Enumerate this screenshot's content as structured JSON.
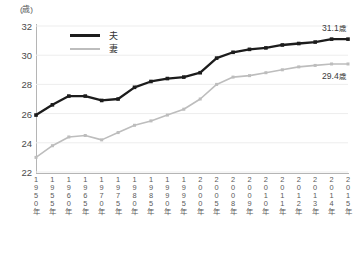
{
  "axis": {
    "unit_label": "(歳)",
    "y_ticks": [
      "32",
      "30",
      "28",
      "26",
      "24",
      "22"
    ],
    "x_ticks": [
      "1950年",
      "1955年",
      "1960年",
      "1965年",
      "1970年",
      "1975年",
      "1980年",
      "1985年",
      "1990年",
      "1995年",
      "2000年",
      "2005年",
      "2008年",
      "2009年",
      "2010年",
      "2011年",
      "2012年",
      "2013年",
      "2014年",
      "2015年"
    ]
  },
  "legend": {
    "items": [
      {
        "label": "夫",
        "color": "#1c1c1c"
      },
      {
        "label": "妻",
        "color": "#bdbdbd"
      }
    ]
  },
  "annotations": {
    "husband_end_value": "31.1",
    "husband_end_unit": "歳",
    "wife_end_value": "29.4",
    "wife_end_unit": "歳"
  },
  "chart_data": {
    "type": "line",
    "title": "",
    "subtitle": "",
    "xlabel": "",
    "ylabel": "(歳)",
    "ylim": [
      22,
      32
    ],
    "ytick_step": 2,
    "grid": true,
    "legend_position": "top-left",
    "categories": [
      "1950年",
      "1955年",
      "1960年",
      "1965年",
      "1970年",
      "1975年",
      "1980年",
      "1985年",
      "1990年",
      "1995年",
      "2000年",
      "2005年",
      "2008年",
      "2009年",
      "2010年",
      "2011年",
      "2012年",
      "2013年",
      "2014年",
      "2015年"
    ],
    "series": [
      {
        "name": "夫",
        "color": "#1c1c1c",
        "values": [
          25.9,
          26.6,
          27.2,
          27.2,
          26.9,
          27.0,
          27.8,
          28.2,
          28.4,
          28.5,
          28.8,
          29.8,
          30.2,
          30.4,
          30.5,
          30.7,
          30.8,
          30.9,
          31.1,
          31.1
        ]
      },
      {
        "name": "妻",
        "color": "#bdbdbd",
        "values": [
          23.0,
          23.8,
          24.4,
          24.5,
          24.2,
          24.7,
          25.2,
          25.5,
          25.9,
          26.3,
          27.0,
          28.0,
          28.5,
          28.6,
          28.8,
          29.0,
          29.2,
          29.3,
          29.4,
          29.4
        ]
      }
    ],
    "annotations": [
      {
        "series": "夫",
        "category": "2015年",
        "text": "31.1 歳"
      },
      {
        "series": "妻",
        "category": "2015年",
        "text": "29.4 歳"
      }
    ]
  }
}
